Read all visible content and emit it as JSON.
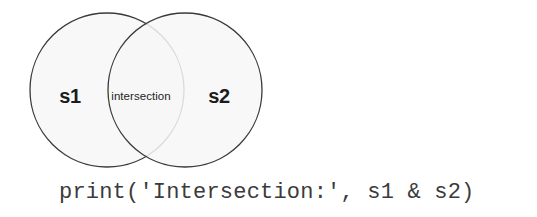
{
  "figure": {
    "type": "venn-diagram",
    "background_color": "#ffffff",
    "circle_fill_color": "#f7f7f7",
    "circle_stroke_color": "#3a3a3a",
    "text_color": "#1c1c1c",
    "code_text_color": "#3b3b3b",
    "left_circle": {
      "label": "s1",
      "center_x": 107,
      "center_y": 90,
      "radius": 77
    },
    "right_circle": {
      "label": "s2",
      "center_x": 185,
      "center_y": 90,
      "radius": 77
    },
    "overlap": {
      "label": "intersection"
    }
  },
  "code": {
    "line": "print('Intersection:', s1 & s2)"
  }
}
